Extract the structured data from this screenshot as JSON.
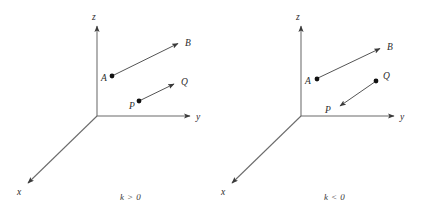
{
  "figure": {
    "title": "",
    "background_color": "#ffffff",
    "width": 431,
    "height": 219,
    "axis_color": "#6b6b6b",
    "vector_color": "#555555",
    "point_color": "#111111",
    "label_color": "#2b2b2b"
  },
  "panels": [
    {
      "id": "left-panel",
      "caption": "k > 0",
      "origin": {
        "x": 97,
        "y": 116
      },
      "axes": [
        {
          "name": "z-axis",
          "label": "z",
          "from": {
            "x": 97,
            "y": 116
          },
          "to": {
            "x": 97,
            "y": 26
          },
          "label_pos": {
            "x": 94,
            "y": 20
          }
        },
        {
          "name": "y-axis",
          "label": "y",
          "from": {
            "x": 97,
            "y": 116
          },
          "to": {
            "x": 190,
            "y": 116
          },
          "label_pos": {
            "x": 196,
            "y": 120
          }
        },
        {
          "name": "x-axis",
          "label": "x",
          "from": {
            "x": 97,
            "y": 116
          },
          "to": {
            "x": 28,
            "y": 183
          },
          "label_pos": {
            "x": 18,
            "y": 194
          }
        }
      ],
      "points": [
        {
          "name": "A",
          "label": "A",
          "x": 112,
          "y": 76,
          "label_pos": {
            "x": 102,
            "y": 81
          }
        },
        {
          "name": "B",
          "label": "B",
          "x": 181,
          "y": 42,
          "label_pos": {
            "x": 186,
            "y": 45
          }
        },
        {
          "name": "P",
          "label": "P",
          "x": 139,
          "y": 101,
          "label_pos": {
            "x": 130,
            "y": 108
          }
        },
        {
          "name": "Q",
          "label": "Q",
          "x": 177,
          "y": 82,
          "label_pos": {
            "x": 182,
            "y": 83
          }
        }
      ],
      "vectors": [
        {
          "name": "vector-AB",
          "from": "A",
          "to": "B",
          "arrow_at": "B",
          "x1": 113,
          "y1": 75,
          "x2": 181,
          "y2": 42
        },
        {
          "name": "vector-PQ",
          "from": "P",
          "to": "Q",
          "arrow_at": "Q",
          "x1": 140,
          "y1": 100,
          "x2": 177,
          "y2": 82
        }
      ]
    },
    {
      "id": "right-panel",
      "caption": "k < 0",
      "origin": {
        "x": 301,
        "y": 116
      },
      "axes": [
        {
          "name": "z-axis",
          "label": "z",
          "from": {
            "x": 301,
            "y": 116
          },
          "to": {
            "x": 301,
            "y": 26
          },
          "label_pos": {
            "x": 297,
            "y": 20
          }
        },
        {
          "name": "y-axis",
          "label": "y",
          "from": {
            "x": 301,
            "y": 116
          },
          "to": {
            "x": 394,
            "y": 116
          },
          "label_pos": {
            "x": 400,
            "y": 120
          }
        },
        {
          "name": "x-axis",
          "label": "x",
          "from": {
            "x": 301,
            "y": 116
          },
          "to": {
            "x": 232,
            "y": 183
          },
          "label_pos": {
            "x": 222,
            "y": 194
          }
        }
      ],
      "points": [
        {
          "name": "A",
          "label": "A",
          "x": 317,
          "y": 79,
          "label_pos": {
            "x": 306,
            "y": 84
          }
        },
        {
          "name": "B",
          "label": "B",
          "x": 383,
          "y": 47,
          "label_pos": {
            "x": 388,
            "y": 49
          }
        },
        {
          "name": "P",
          "label": "P",
          "x": 335,
          "y": 109,
          "label_pos": {
            "x": 326,
            "y": 112
          }
        },
        {
          "name": "Q",
          "label": "Q",
          "x": 376,
          "y": 81,
          "label_pos": {
            "x": 384,
            "y": 82
          }
        }
      ],
      "vectors": [
        {
          "name": "vector-AB",
          "from": "A",
          "to": "B",
          "arrow_at": "B",
          "x1": 318,
          "y1": 78,
          "x2": 383,
          "y2": 47
        },
        {
          "name": "vector-QP",
          "from": "Q",
          "to": "P",
          "arrow_at": "P",
          "x1": 375,
          "y1": 82,
          "x2": 337,
          "y2": 108
        }
      ]
    }
  ]
}
